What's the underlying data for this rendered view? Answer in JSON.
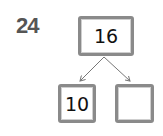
{
  "question": {
    "number": "24"
  },
  "number_bond": {
    "whole": "16",
    "parts": [
      "10",
      ""
    ]
  },
  "colors": {
    "box_border": "#8a8a8a",
    "arrow": "#777777",
    "question_number": "#555555"
  }
}
